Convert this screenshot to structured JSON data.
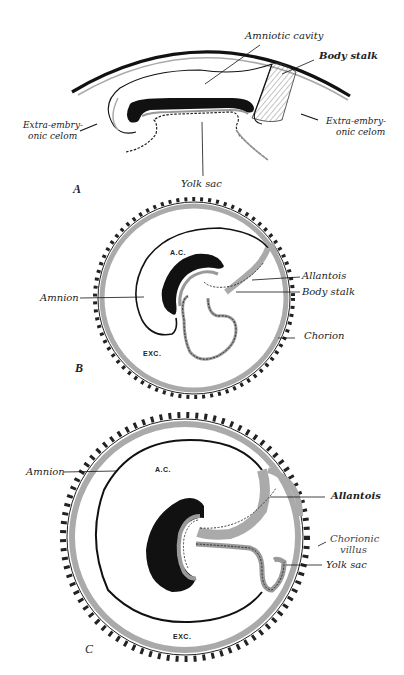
{
  "figure": {
    "panels": [
      {
        "id": "A",
        "letter": "A",
        "labels": {
          "amniotic_cavity": "Amniotic cavity",
          "body_stalk": "Body stalk",
          "extra_embryonic_celom_left_1": "Extra-embry-",
          "extra_embryonic_celom_left_2": "onic celom",
          "extra_embryonic_celom_right_1": "Extra-embry-",
          "extra_embryonic_celom_right_2": "onic celom",
          "yolk_sac": "Yolk sac"
        }
      },
      {
        "id": "B",
        "letter": "B",
        "labels": {
          "amnion": "Amnion",
          "allantois": "Allantois",
          "body_stalk": "Body stalk",
          "chorion": "Chorion",
          "ac": "A.C.",
          "exc": "EXC."
        }
      },
      {
        "id": "C",
        "letter": "C",
        "labels": {
          "amnion": "Amnion",
          "allantois": "Allantois",
          "chorionic_villus_1": "Chorionic",
          "chorionic_villus_2": "villus",
          "yolk_sac": "Yolk sac",
          "ac": "A.C.",
          "exc": "EXC."
        }
      }
    ],
    "colors": {
      "ink": "#111111",
      "membrane_gray": "#a8a8a8",
      "background": "#ffffff"
    }
  }
}
